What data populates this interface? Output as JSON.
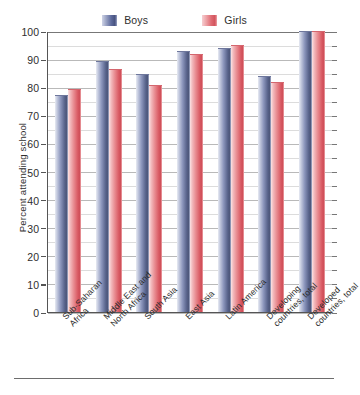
{
  "chart_data": {
    "type": "bar",
    "title": "",
    "subtitle": "",
    "xlabel": "",
    "ylabel": "Percent attending school",
    "ylim": [
      0,
      100
    ],
    "ytick_step": 10,
    "yminor_step": 5,
    "grid": true,
    "legend_position": "top-center",
    "categories": [
      "Sub-Saharan Africa",
      "Middle East and North Africa",
      "South Asia",
      "East Asia",
      "Latin America",
      "Developing countries, total",
      "Developed countries, total"
    ],
    "category_lines": [
      [
        "Sub-Saharan",
        "Africa"
      ],
      [
        "Middle East and",
        "North Africa"
      ],
      [
        "South Asia",
        ""
      ],
      [
        "East Asia",
        ""
      ],
      [
        "Latin America",
        ""
      ],
      [
        "Developing",
        "countries, total"
      ],
      [
        "Developed",
        "countries, total"
      ]
    ],
    "ytick_labels": [
      "0",
      "10",
      "20",
      "30",
      "40",
      "50",
      "60",
      "70",
      "80",
      "90",
      "100"
    ],
    "series": [
      {
        "name": "Boys",
        "color": "#5c678f",
        "values": [
          77,
          89,
          84.5,
          92.5,
          93.5,
          83.5,
          99.5
        ]
      },
      {
        "name": "Girls",
        "color": "#db5f68",
        "values": [
          79,
          86,
          80.5,
          91.5,
          94.5,
          81.5,
          99.5
        ]
      }
    ]
  },
  "legend": {
    "items": [
      {
        "label": "Boys",
        "swatch": "boys"
      },
      {
        "label": "Girls",
        "swatch": "girls"
      }
    ]
  }
}
